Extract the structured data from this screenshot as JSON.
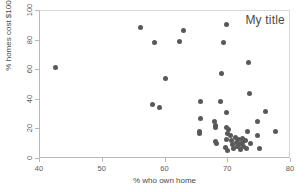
{
  "chart_data": {
    "type": "scatter",
    "title": "My title",
    "xlabel": "% who own home",
    "ylabel": "% homes cost $100K+",
    "xlim": [
      40,
      80
    ],
    "ylim": [
      0,
      100
    ],
    "xticks": [
      40,
      50,
      60,
      70,
      80
    ],
    "yticks": [
      0,
      20,
      40,
      60,
      80,
      100
    ],
    "grid": false,
    "legend": null,
    "marker_color": "#595959",
    "marker_size": 5,
    "n_points": 51,
    "points": [
      {
        "x": 42.5,
        "y": 62.0
      },
      {
        "x": 56.0,
        "y": 89.0
      },
      {
        "x": 58.2,
        "y": 78.7
      },
      {
        "x": 62.3,
        "y": 79.3
      },
      {
        "x": 62.8,
        "y": 87.0
      },
      {
        "x": 60.0,
        "y": 54.3
      },
      {
        "x": 58.0,
        "y": 36.9
      },
      {
        "x": 59.0,
        "y": 34.7
      },
      {
        "x": 65.5,
        "y": 38.6
      },
      {
        "x": 65.5,
        "y": 27.3
      },
      {
        "x": 65.4,
        "y": 18.8
      },
      {
        "x": 65.4,
        "y": 17.4
      },
      {
        "x": 67.8,
        "y": 25.6
      },
      {
        "x": 67.9,
        "y": 22.6
      },
      {
        "x": 67.9,
        "y": 21.3
      },
      {
        "x": 68.0,
        "y": 11.9
      },
      {
        "x": 68.2,
        "y": 10.6
      },
      {
        "x": 68.8,
        "y": 38.8
      },
      {
        "x": 69.8,
        "y": 91.2
      },
      {
        "x": 69.3,
        "y": 78.9
      },
      {
        "x": 68.9,
        "y": 57.7
      },
      {
        "x": 69.8,
        "y": 31.2
      },
      {
        "x": 69.8,
        "y": 21.4
      },
      {
        "x": 70.0,
        "y": 19.6
      },
      {
        "x": 69.9,
        "y": 17.5
      },
      {
        "x": 69.7,
        "y": 13.0
      },
      {
        "x": 69.6,
        "y": 8.1
      },
      {
        "x": 69.9,
        "y": 5.8
      },
      {
        "x": 70.4,
        "y": 16.0
      },
      {
        "x": 70.5,
        "y": 12.6
      },
      {
        "x": 70.6,
        "y": 9.6
      },
      {
        "x": 70.8,
        "y": 6.8
      },
      {
        "x": 71.1,
        "y": 14.6
      },
      {
        "x": 71.3,
        "y": 11.2
      },
      {
        "x": 71.4,
        "y": 8.4
      },
      {
        "x": 71.6,
        "y": 13.2
      },
      {
        "x": 71.8,
        "y": 10.0
      },
      {
        "x": 71.9,
        "y": 6.4
      },
      {
        "x": 72.2,
        "y": 14.0
      },
      {
        "x": 72.3,
        "y": 11.0
      },
      {
        "x": 72.5,
        "y": 8.6
      },
      {
        "x": 72.8,
        "y": 12.2
      },
      {
        "x": 72.9,
        "y": 7.2
      },
      {
        "x": 73.2,
        "y": 65.0
      },
      {
        "x": 73.4,
        "y": 44.4
      },
      {
        "x": 73.0,
        "y": 18.8
      },
      {
        "x": 73.5,
        "y": 10.4
      },
      {
        "x": 74.7,
        "y": 25.3
      },
      {
        "x": 74.6,
        "y": 16.2
      },
      {
        "x": 75.0,
        "y": 6.9
      },
      {
        "x": 75.9,
        "y": 31.8
      },
      {
        "x": 77.5,
        "y": 18.9
      }
    ]
  }
}
